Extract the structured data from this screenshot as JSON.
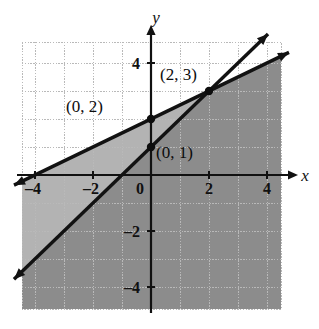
{
  "figure": {
    "kind": "coordinate-plane-graph",
    "background_color": "#ffffff",
    "plot_area": {
      "left_px": 22,
      "top_px": 42,
      "right_px": 281,
      "bottom_px": 309,
      "grid_color": "#b9b9b9",
      "grid_style": "dotted"
    },
    "axes": {
      "x_label": "x",
      "y_label": "y",
      "axis_color": "#111111",
      "origin_px": {
        "x": 151,
        "y": 175
      },
      "unit_px": {
        "x": 29,
        "y": 28
      },
      "x_range": [
        -4.45,
        4.48
      ],
      "y_range": [
        -4.79,
        4.75
      ],
      "x_ticks": [
        {
          "value": -4,
          "label": "–4"
        },
        {
          "value": -2,
          "label": "–2"
        },
        {
          "value": 0,
          "label": "0"
        },
        {
          "value": 2,
          "label": "2"
        },
        {
          "value": 4,
          "label": "4"
        }
      ],
      "y_ticks": [
        {
          "value": 4,
          "label": "4"
        },
        {
          "value": -2,
          "label": "–2"
        },
        {
          "value": -4,
          "label": "–4"
        }
      ]
    },
    "shading": {
      "light_fill": "#b3b3b3",
      "dark_fill": "#8c8c8c",
      "white_fill": "#ffffff",
      "description": "Region below the shallow line is lightly shaded; region below the shallow line and right of the steep line is darkly shaded; region above both lines is unshaded."
    },
    "lines": [
      {
        "name": "shallow-line",
        "slope": 0.5,
        "intercept": 2,
        "through": [
          [
            0,
            2
          ],
          [
            2,
            3
          ]
        ],
        "color": "#121212",
        "width_px": 3.4,
        "arrows": "both"
      },
      {
        "name": "steep-line",
        "slope": 1,
        "intercept": 1,
        "through": [
          [
            0,
            1
          ],
          [
            2,
            3
          ]
        ],
        "color": "#121212",
        "width_px": 3.4,
        "arrows": "both"
      }
    ],
    "points": [
      {
        "name": "point-0-2",
        "x": 0,
        "y": 2,
        "label": "(0, 2)",
        "label_px": {
          "x": 66,
          "y": 112
        },
        "filled": true
      },
      {
        "name": "point-2-3",
        "x": 2,
        "y": 3,
        "label": "(2, 3)",
        "label_px": {
          "x": 160,
          "y": 80
        },
        "filled": true
      },
      {
        "name": "point-0-1",
        "x": 0,
        "y": 1,
        "label": "(0, 1)",
        "label_px": {
          "x": 156,
          "y": 158
        },
        "filled": true
      }
    ]
  },
  "chart_data": {
    "type": "line",
    "title": "",
    "xlabel": "x",
    "ylabel": "y",
    "xlim": [
      -4.45,
      4.48
    ],
    "ylim": [
      -4.79,
      4.75
    ],
    "xticks": [
      -4,
      -2,
      0,
      2,
      4
    ],
    "yticks": [
      4,
      -2,
      -4
    ],
    "grid": true,
    "legend": "none",
    "series": [
      {
        "name": "y = 0.5x + 2",
        "slope": 0.5,
        "intercept": 2,
        "points": [
          [
            -4,
            0
          ],
          [
            -2,
            1
          ],
          [
            0,
            2
          ],
          [
            2,
            3
          ],
          [
            4,
            4
          ]
        ],
        "style": "solid",
        "arrows": "both"
      },
      {
        "name": "y = x + 1",
        "slope": 1,
        "intercept": 1,
        "points": [
          [
            -4,
            -3
          ],
          [
            -2,
            -1
          ],
          [
            0,
            1
          ],
          [
            2,
            3
          ],
          [
            4,
            5
          ]
        ],
        "style": "solid",
        "arrows": "both"
      }
    ],
    "annotations": [
      {
        "text": "(0, 2)",
        "x": 0,
        "y": 2
      },
      {
        "text": "(2, 3)",
        "x": 2,
        "y": 3
      },
      {
        "text": "(0, 1)",
        "x": 0,
        "y": 1
      }
    ],
    "shaded_regions": [
      {
        "name": "below-shallow-line",
        "inequality": "y <= 0.5x + 2",
        "fill": "#b3b3b3"
      },
      {
        "name": "below-shallow-and-below-steep",
        "inequality": "y <= 0.5x + 2 and y <= x + 1",
        "fill": "#8c8c8c"
      }
    ]
  }
}
